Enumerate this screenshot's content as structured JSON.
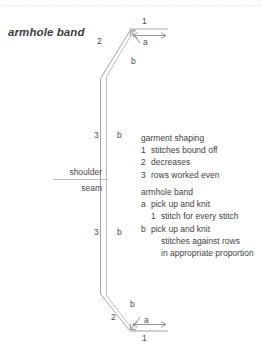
{
  "title": "armhole band",
  "diagram": {
    "top": {
      "edge_label": "1",
      "arrow_label": "a",
      "diagonal_label": "2",
      "band_label": "b"
    },
    "middle": {
      "upper_rows_label": "3",
      "upper_band_label": "b",
      "lower_rows_label": "3",
      "lower_band_label": "b"
    },
    "bottom": {
      "band_label": "b",
      "diagonal_label": "2",
      "arrow_label": "a",
      "edge_label": "1"
    },
    "shoulder_label": "shoulder",
    "seam_label": "seam"
  },
  "garment_shaping": {
    "heading": "garment shaping",
    "items": [
      {
        "key": "1",
        "text": "stitches bound off"
      },
      {
        "key": "2",
        "text": "decreases"
      },
      {
        "key": "3",
        "text": "rows worked even"
      }
    ]
  },
  "armhole_band": {
    "heading": "armhole band",
    "items": [
      {
        "key": "a",
        "text": "pick up and knit"
      },
      {
        "key": "1",
        "text": "stitch for every stitch",
        "indent": true
      },
      {
        "key": "b",
        "text": "pick up and knit"
      },
      {
        "key": "",
        "text": "stitches against rows",
        "indent": true
      },
      {
        "key": "",
        "text": "in appropriate proportion",
        "indent": true
      }
    ]
  },
  "colors": {
    "line": "#8a8a8a",
    "thin_line": "#b9b9b9",
    "text": "#3f3f3f",
    "dotted_rule": "#d8d8d8"
  }
}
